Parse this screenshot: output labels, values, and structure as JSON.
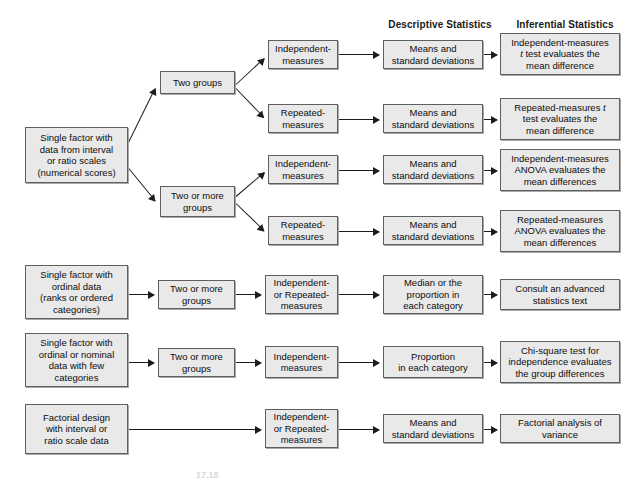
{
  "figure": {
    "caption_fragment": "17.18",
    "box_fill": "#e9e9e9",
    "box_border": "#5f5f5f",
    "arrow_color": "#1c1c1c",
    "background": "#ffffff"
  },
  "column_headers": [
    {
      "label": "Descriptive Statistics",
      "x": 375,
      "y": 19,
      "width": 130
    },
    {
      "label": "Inferential Statistics",
      "x": 495,
      "y": 19,
      "width": 140
    }
  ],
  "nodes": [
    {
      "id": "start-interval",
      "lines": [
        "Single factor with",
        "data from interval",
        "or ratio scales",
        "(numerical scores)"
      ],
      "x": 25,
      "y": 127,
      "w": 103,
      "h": 56
    },
    {
      "id": "two-groups",
      "lines": [
        "Two groups"
      ],
      "x": 160,
      "y": 71,
      "w": 75,
      "h": 23
    },
    {
      "id": "two-or-more-groups-a",
      "lines": [
        "Two or more",
        "groups"
      ],
      "x": 160,
      "y": 186,
      "w": 75,
      "h": 31
    },
    {
      "id": "r1-independent",
      "lines": [
        "Independent-",
        "measures"
      ],
      "x": 268,
      "y": 40,
      "w": 70,
      "h": 29
    },
    {
      "id": "r1-means",
      "lines": [
        "Means and",
        "standard deviations"
      ],
      "x": 383,
      "y": 40,
      "w": 100,
      "h": 29
    },
    {
      "id": "r1-inferential",
      "lines": [
        "Independent-measures",
        "<i>t</i> test evaluates the",
        "mean difference"
      ],
      "x": 500,
      "y": 33,
      "w": 120,
      "h": 42
    },
    {
      "id": "r2-repeated",
      "lines": [
        "Repeated-",
        "measures"
      ],
      "x": 268,
      "y": 104,
      "w": 70,
      "h": 29
    },
    {
      "id": "r2-means",
      "lines": [
        "Means and",
        "standard deviations"
      ],
      "x": 383,
      "y": 104,
      "w": 100,
      "h": 29
    },
    {
      "id": "r2-inferential",
      "lines": [
        "Repeated-measures <i>t</i>",
        "test evaluates the",
        "mean difference"
      ],
      "x": 500,
      "y": 98,
      "w": 120,
      "h": 42
    },
    {
      "id": "r3-independent",
      "lines": [
        "Independent-",
        "measures"
      ],
      "x": 268,
      "y": 155,
      "w": 70,
      "h": 29
    },
    {
      "id": "r3-means",
      "lines": [
        "Means and",
        "standard deviations"
      ],
      "x": 383,
      "y": 155,
      "w": 100,
      "h": 29
    },
    {
      "id": "r3-inferential",
      "lines": [
        "Independent-measures",
        "ANOVA evaluates the",
        "mean differences"
      ],
      "x": 500,
      "y": 149,
      "w": 120,
      "h": 42
    },
    {
      "id": "r4-repeated",
      "lines": [
        "Repeated-",
        "measures"
      ],
      "x": 268,
      "y": 216,
      "w": 70,
      "h": 29
    },
    {
      "id": "r4-means",
      "lines": [
        "Means and",
        "standard deviations"
      ],
      "x": 383,
      "y": 216,
      "w": 100,
      "h": 29
    },
    {
      "id": "r4-inferential",
      "lines": [
        "Repeated-measures",
        "ANOVA evaluates the",
        "mean differences"
      ],
      "x": 500,
      "y": 210,
      "w": 120,
      "h": 42
    },
    {
      "id": "start-ordinal",
      "lines": [
        "Single factor with",
        "ordinal data",
        "(ranks or ordered",
        "categories)"
      ],
      "x": 25,
      "y": 265,
      "w": 103,
      "h": 54
    },
    {
      "id": "two-or-more-groups-b",
      "lines": [
        "Two or more",
        "groups"
      ],
      "x": 158,
      "y": 280,
      "w": 77,
      "h": 29
    },
    {
      "id": "r5-ind-or-rep",
      "lines": [
        "Independent-",
        "or Repeated-",
        "measures"
      ],
      "x": 265,
      "y": 275,
      "w": 73,
      "h": 39
    },
    {
      "id": "r5-descriptive",
      "lines": [
        "Median or the",
        "proportion in",
        "each category"
      ],
      "x": 383,
      "y": 275,
      "w": 100,
      "h": 39
    },
    {
      "id": "r5-inferential",
      "lines": [
        "Consult an advanced",
        "statistics text"
      ],
      "x": 500,
      "y": 279,
      "w": 120,
      "h": 31
    },
    {
      "id": "start-nominal",
      "lines": [
        "Single factor with",
        "ordinal or nominal",
        "data with few",
        "categories"
      ],
      "x": 25,
      "y": 333,
      "w": 103,
      "h": 54
    },
    {
      "id": "two-or-more-groups-c",
      "lines": [
        "Two or more",
        "groups"
      ],
      "x": 158,
      "y": 348,
      "w": 77,
      "h": 29
    },
    {
      "id": "r6-independent",
      "lines": [
        "Independent-",
        "measures"
      ],
      "x": 265,
      "y": 346,
      "w": 73,
      "h": 32
    },
    {
      "id": "r6-descriptive",
      "lines": [
        "Proportion",
        "in each category"
      ],
      "x": 383,
      "y": 346,
      "w": 100,
      "h": 32
    },
    {
      "id": "r6-inferential",
      "lines": [
        "Chi-square test for",
        "independence evaluates",
        "the group differences"
      ],
      "x": 500,
      "y": 341,
      "w": 120,
      "h": 42
    },
    {
      "id": "start-factorial",
      "lines": [
        "Factorial design",
        "with interval or",
        "ratio scale data"
      ],
      "x": 25,
      "y": 404,
      "w": 103,
      "h": 50
    },
    {
      "id": "r7-ind-or-rep",
      "lines": [
        "Independent-",
        "or Repeated-",
        "measures"
      ],
      "x": 265,
      "y": 409,
      "w": 73,
      "h": 39
    },
    {
      "id": "r7-descriptive",
      "lines": [
        "Means and",
        "standard deviations"
      ],
      "x": 383,
      "y": 414,
      "w": 100,
      "h": 29
    },
    {
      "id": "r7-inferential",
      "lines": [
        "Factorial analysis of",
        "variance"
      ],
      "x": 500,
      "y": 414,
      "w": 120,
      "h": 29
    }
  ],
  "arrows": [
    {
      "id": "start-to-two-groups",
      "x1": 128,
      "y1": 143,
      "x2": 155,
      "y2": 88
    },
    {
      "id": "start-to-two-or-more",
      "x1": 128,
      "y1": 167,
      "x2": 155,
      "y2": 200
    },
    {
      "id": "two-groups-to-r1",
      "x1": 236,
      "y1": 84,
      "x2": 264,
      "y2": 58
    },
    {
      "id": "two-groups-to-r2",
      "x1": 236,
      "y1": 88,
      "x2": 264,
      "y2": 117
    },
    {
      "id": "two-or-more-to-r3",
      "x1": 236,
      "y1": 196,
      "x2": 264,
      "y2": 172
    },
    {
      "id": "two-or-more-to-r4",
      "x1": 236,
      "y1": 203,
      "x2": 264,
      "y2": 230
    },
    {
      "id": "r1-ind-to-means",
      "x1": 339,
      "y1": 54,
      "x2": 379,
      "y2": 54
    },
    {
      "id": "r1-means-to-inf",
      "x1": 484,
      "y1": 54,
      "x2": 497,
      "y2": 54
    },
    {
      "id": "r2-rep-to-means",
      "x1": 339,
      "y1": 119,
      "x2": 379,
      "y2": 119
    },
    {
      "id": "r2-means-to-inf",
      "x1": 484,
      "y1": 119,
      "x2": 497,
      "y2": 119
    },
    {
      "id": "r3-ind-to-means",
      "x1": 339,
      "y1": 170,
      "x2": 379,
      "y2": 170
    },
    {
      "id": "r3-means-to-inf",
      "x1": 484,
      "y1": 170,
      "x2": 497,
      "y2": 170
    },
    {
      "id": "r4-rep-to-means",
      "x1": 339,
      "y1": 231,
      "x2": 379,
      "y2": 231
    },
    {
      "id": "r4-means-to-inf",
      "x1": 484,
      "y1": 231,
      "x2": 497,
      "y2": 231
    },
    {
      "id": "ordinal-to-groups",
      "x1": 129,
      "y1": 294,
      "x2": 154,
      "y2": 294
    },
    {
      "id": "ordinal-groups-to-node",
      "x1": 236,
      "y1": 294,
      "x2": 261,
      "y2": 294
    },
    {
      "id": "ordinal-node-to-desc",
      "x1": 339,
      "y1": 294,
      "x2": 379,
      "y2": 294
    },
    {
      "id": "ordinal-desc-to-inf",
      "x1": 484,
      "y1": 294,
      "x2": 497,
      "y2": 294
    },
    {
      "id": "nominal-to-groups",
      "x1": 129,
      "y1": 362,
      "x2": 154,
      "y2": 362
    },
    {
      "id": "nominal-groups-to-node",
      "x1": 236,
      "y1": 362,
      "x2": 261,
      "y2": 362
    },
    {
      "id": "nominal-node-to-desc",
      "x1": 339,
      "y1": 362,
      "x2": 379,
      "y2": 362
    },
    {
      "id": "nominal-desc-to-inf",
      "x1": 484,
      "y1": 362,
      "x2": 497,
      "y2": 362
    },
    {
      "id": "factorial-to-node",
      "x1": 129,
      "y1": 429,
      "x2": 261,
      "y2": 429
    },
    {
      "id": "factorial-node-to-desc",
      "x1": 339,
      "y1": 429,
      "x2": 379,
      "y2": 429
    },
    {
      "id": "factorial-desc-to-inf",
      "x1": 484,
      "y1": 429,
      "x2": 497,
      "y2": 429
    }
  ]
}
